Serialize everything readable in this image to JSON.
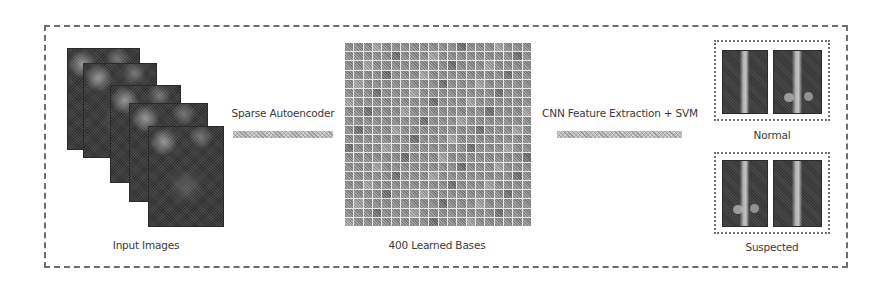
{
  "diagram": {
    "type": "pipeline",
    "stages": [
      {
        "id": "input",
        "label": "Input Images",
        "image_count": 5
      },
      {
        "id": "bases",
        "label": "400 Learned Bases",
        "grid_rows": 20,
        "grid_cols": 20
      }
    ],
    "edges": [
      {
        "from": "input",
        "to": "bases",
        "label": "Sparse Autoencoder"
      },
      {
        "from": "bases",
        "to": "output",
        "label": "CNN Feature Extraction + SVM"
      }
    ],
    "outputs": [
      {
        "id": "normal",
        "label": "Normal",
        "image_count": 2
      },
      {
        "id": "suspected",
        "label": "Suspected",
        "image_count": 2
      }
    ]
  },
  "labels": {
    "input_images": "Input Images",
    "sparse_autoencoder": "Sparse Autoencoder",
    "learned_bases": "400 Learned Bases",
    "cnn_svm": "CNN Feature Extraction + SVM",
    "normal": "Normal",
    "suspected": "Suspected"
  },
  "colors": {
    "frame": "#6e6e6e",
    "text": "#3a3a3a",
    "arrow": "#bdbdbd",
    "image_dark": "#333333"
  }
}
